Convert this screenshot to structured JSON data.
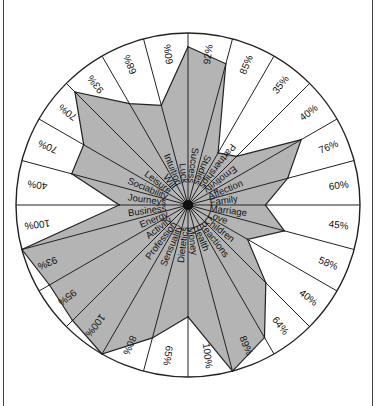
{
  "chart_data": {
    "type": "radar",
    "title": "",
    "rlim": [
      0,
      100
    ],
    "unit": "%",
    "fill_color": "#b4b4b4",
    "line_color": "#222222",
    "categories": [
      "Success",
      "Studies",
      "Partnerships",
      "Emotivity",
      "Affection",
      "Family",
      "Marriage",
      "Love",
      "Children",
      "Reactions",
      "Health",
      "Money",
      "Dietetics",
      "Sensuality",
      "Profession",
      "Activity",
      "Energy",
      "Business",
      "Journeys",
      "Sociability",
      "Leisure",
      "Will",
      "Intuition",
      "Luck"
    ],
    "values": [
      92,
      85,
      35,
      40,
      76,
      60,
      45,
      58,
      40,
      64,
      89,
      100,
      65,
      80,
      100,
      95,
      93,
      100,
      40,
      70,
      70,
      93,
      68,
      60
    ],
    "value_labels": [
      "92%",
      "85%",
      "35%",
      "40%",
      "76%",
      "60%",
      "45%",
      "58%",
      "40%",
      "64%",
      "89%",
      "100%",
      "65%",
      "80%",
      "100%",
      "95%",
      "93%",
      "100%",
      "40%",
      "70%",
      "70%",
      "93%",
      "68%",
      "60%"
    ]
  }
}
